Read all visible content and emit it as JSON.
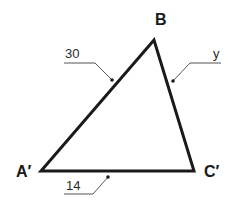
{
  "diagram": {
    "type": "triangle",
    "colors": {
      "stroke": "#1a1a1a",
      "leader": "#555555",
      "background": "#ffffff"
    },
    "vertices": [
      {
        "id": "A",
        "label": "A′",
        "x": 41,
        "y": 171
      },
      {
        "id": "B",
        "label": "B",
        "x": 154,
        "y": 40
      },
      {
        "id": "C",
        "label": "C′",
        "x": 194,
        "y": 171
      }
    ],
    "sides": [
      {
        "from": "A",
        "to": "B",
        "label": "30"
      },
      {
        "from": "B",
        "to": "C",
        "label": "y"
      },
      {
        "from": "A",
        "to": "C",
        "label": "14"
      }
    ]
  },
  "labels": {
    "vertex_a": "A′",
    "vertex_b": "B",
    "vertex_c": "C′",
    "side_ab": "30",
    "side_bc": "y",
    "side_ac": "14"
  }
}
